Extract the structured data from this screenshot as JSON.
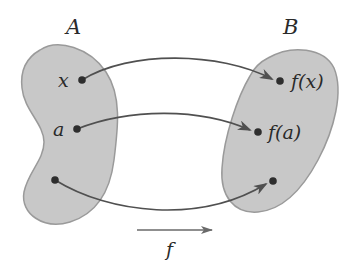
{
  "diagram": {
    "type": "function-mapping",
    "sets": [
      {
        "id": "A",
        "label": "A",
        "role": "domain"
      },
      {
        "id": "B",
        "label": "B",
        "role": "codomain"
      }
    ],
    "domain_points": [
      {
        "id": "x",
        "label": "x"
      },
      {
        "id": "a",
        "label": "a"
      },
      {
        "id": "unlabeled-domain",
        "label": ""
      }
    ],
    "codomain_points": [
      {
        "id": "fx",
        "label": "f(x)"
      },
      {
        "id": "fa",
        "label": "f(a)"
      },
      {
        "id": "unlabeled-codomain",
        "label": ""
      }
    ],
    "mappings": [
      {
        "from": "x",
        "to": "fx"
      },
      {
        "from": "a",
        "to": "fa"
      },
      {
        "from": "unlabeled-domain",
        "to": "unlabeled-codomain"
      }
    ],
    "function_label": "f",
    "colors": {
      "blob_fill": "#c8c8c8",
      "blob_edge": "#9a9a9a",
      "arrow": "#505050",
      "dot": "#2e2e2e",
      "text": "#2a2a2a"
    }
  }
}
